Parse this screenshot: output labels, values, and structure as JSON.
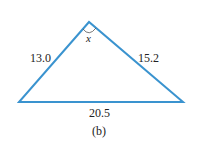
{
  "figure": {
    "caption": "(b)",
    "shape": "triangle",
    "stroke_color": "#3a93cf",
    "angle_label": "x",
    "sides": {
      "left": "13.0",
      "right": "15.2",
      "bottom": "20.5"
    },
    "vertices": {
      "top": [
        89,
        22
      ],
      "bottom_left": [
        19,
        102
      ],
      "bottom_right": [
        183,
        102
      ]
    }
  }
}
